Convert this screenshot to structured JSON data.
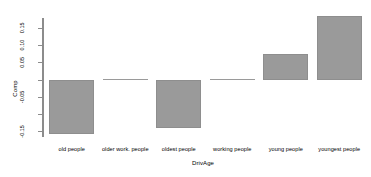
{
  "chart_data": {
    "type": "bar",
    "title": "",
    "xlabel": "DrivAge",
    "ylabel": "Comp",
    "categories": [
      "old people",
      "older work. people",
      "oldest people",
      "working people",
      "young people",
      "youngest people"
    ],
    "values": [
      -0.159,
      0.0,
      -0.141,
      0.0,
      0.074,
      0.185
    ],
    "ylim": [
      -0.175,
      0.19
    ],
    "yticks": [
      0.15,
      0.1,
      0.05,
      0.0,
      -0.05,
      -0.1,
      -0.15
    ],
    "ytick_labels": [
      "0.15",
      "0.10",
      "0.05",
      "",
      "-0.05",
      "",
      "-0.15"
    ],
    "grid": false,
    "legend": null,
    "bar_color": "#9a9a9a",
    "bar_border_color": "#8e8e8e",
    "axis_color": "#8c8c8c",
    "background": "#ffffff"
  }
}
